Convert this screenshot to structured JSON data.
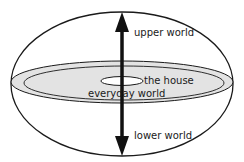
{
  "diagram": {
    "labels": {
      "upper": "upper world",
      "house": "the house",
      "everyday": "everyday world",
      "lower": "lower world"
    },
    "colors": {
      "stroke": "#1a1a1a",
      "disc_fill": "#e3e3e3",
      "background": "#ffffff"
    }
  }
}
